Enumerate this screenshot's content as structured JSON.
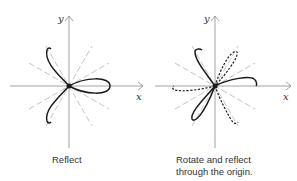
{
  "panels": [
    {
      "id": "reflect",
      "caption": "Reflect",
      "axis_x_label": "x",
      "axis_y_label": "y"
    },
    {
      "id": "rotate-reflect",
      "caption_line1": "Rotate and reflect",
      "caption_line2": "through the origin.",
      "axis_x_label": "x",
      "axis_y_label": "y"
    }
  ],
  "colors": {
    "curve": "#1a1a1a",
    "axis": "#8a8a8a",
    "guide": "#b5b5b5"
  }
}
